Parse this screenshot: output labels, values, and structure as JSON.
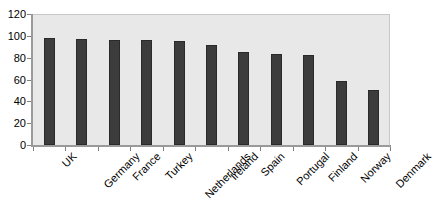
{
  "chart_data": {
    "type": "bar",
    "title": "",
    "subtitle": "",
    "xlabel": "",
    "ylabel": "",
    "categories": [
      "UK",
      "Germany",
      "France",
      "Turkey",
      "Netherlands",
      "Ireland",
      "Spain",
      "Portugal",
      "Finland",
      "Norway",
      "Denmark"
    ],
    "values": [
      98,
      97,
      96,
      96,
      95,
      92,
      85,
      83,
      82,
      59,
      50
    ],
    "ylim": [
      0,
      120
    ],
    "y_ticks": [
      0,
      20,
      40,
      60,
      80,
      100,
      120
    ],
    "y_tick_labels": [
      "0",
      "20",
      "40",
      "60",
      "80",
      "100",
      "120"
    ],
    "grid": false,
    "legend": false,
    "legend_position": "none",
    "series": [
      {
        "name": "",
        "values": [
          98,
          97,
          96,
          96,
          95,
          92,
          85,
          83,
          82,
          59,
          50
        ]
      }
    ]
  },
  "style": {
    "bar_color": "#3c3c3c",
    "bar_border_color": "#2a2a2a",
    "plot_background": "#e8e8e8",
    "page_background": "#ffffff",
    "axis_color": "#9a9a9a",
    "tick_color": "#808080",
    "text_color": "#000000"
  }
}
